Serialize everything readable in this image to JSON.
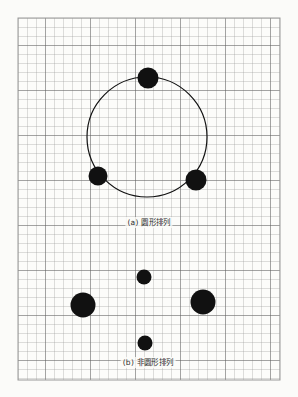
{
  "figure": {
    "background_color": "#fbfbf9",
    "grid": {
      "x": 18,
      "y": 18,
      "width": 262,
      "height": 362,
      "cell_size": 9,
      "line_color": "#8e8e8e",
      "major_line_color": "#5d5d5d",
      "major_every": 5,
      "border_color": "#9a9a9a"
    },
    "dot_color": "#111111",
    "outline_color": "#111111",
    "panels": [
      {
        "id": "panel-a",
        "caption": "(a) 圆形排列",
        "arrangement": "circular",
        "circle_outline": {
          "cx": 147,
          "cy": 137,
          "r": 60,
          "stroke_width": 1.2
        },
        "dots": [
          {
            "name": "dot-top",
            "cx": 148,
            "cy": 78,
            "r": 10.5
          },
          {
            "name": "dot-bottom-left",
            "cx": 98,
            "cy": 176,
            "r": 9.5
          },
          {
            "name": "dot-bottom-right",
            "cx": 196,
            "cy": 180,
            "r": 10.5
          }
        ]
      },
      {
        "id": "panel-b",
        "caption": "(b) 非圆形排列",
        "arrangement": "non-circular",
        "circle_outline": null,
        "dots": [
          {
            "name": "dot-top",
            "cx": 144,
            "cy": 277,
            "r": 7.5
          },
          {
            "name": "dot-left",
            "cx": 83,
            "cy": 305,
            "r": 12.5
          },
          {
            "name": "dot-right",
            "cx": 203,
            "cy": 302,
            "r": 12.5
          },
          {
            "name": "dot-bottom",
            "cx": 145,
            "cy": 343,
            "r": 7.5
          }
        ]
      }
    ]
  }
}
